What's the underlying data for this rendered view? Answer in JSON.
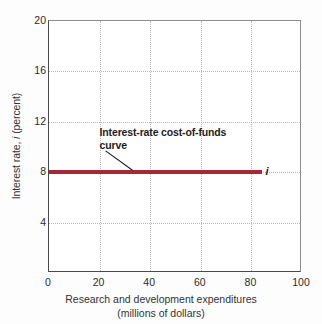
{
  "chart_data": {
    "type": "line",
    "title": "",
    "xlabel": "Research and development expenditures",
    "xlabel_line2": "(millions of dollars)",
    "ylabel_prefix": "Interest rate, ",
    "ylabel_symbol": "i",
    "ylabel_suffix": " (percent)",
    "xlim": [
      0,
      100
    ],
    "ylim": [
      0,
      20
    ],
    "xticks": [
      0,
      20,
      40,
      60,
      80,
      100
    ],
    "yticks": [
      4,
      8,
      12,
      16,
      20
    ],
    "xtick_labels": [
      "0",
      "20",
      "40",
      "60",
      "80",
      "100"
    ],
    "ytick_labels": [
      "4",
      "8",
      "12",
      "16",
      "20"
    ],
    "grid": true,
    "grid_style": "dotted",
    "legend": "none",
    "series": [
      {
        "name": "Interest-rate cost-of-funds curve",
        "symbol": "i",
        "color": "#a82639",
        "x": [
          0,
          84
        ],
        "y": [
          8,
          8
        ],
        "constant_value": 8
      }
    ],
    "annotations": [
      {
        "text": "Interest-rate cost-of-funds\ncurve",
        "x": 20,
        "y": 11.2,
        "bold": true,
        "leader_to_x": 33,
        "leader_to_y": 8
      }
    ]
  },
  "axis": {
    "y_title_prefix": "Interest rate, ",
    "y_title_symbol": "i",
    "y_title_suffix": " (percent)",
    "x_title_line1": "Research and development expenditures",
    "x_title_line2": "(millions of dollars)"
  },
  "colors": {
    "curve": "#a82639",
    "axis": "#4a4a4a",
    "grid": "#b9b9b9",
    "text": "#2b2b2b",
    "background": "#ffffff"
  }
}
